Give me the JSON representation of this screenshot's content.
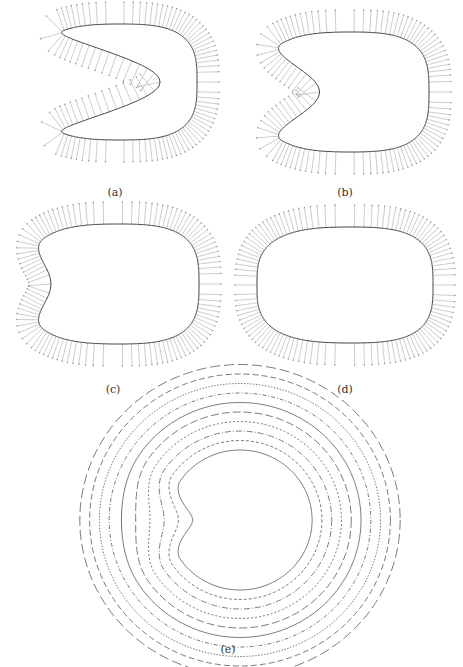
{
  "figure": {
    "panels": [
      {
        "id": "a",
        "label": "(a)",
        "cx": 115,
        "cy": 82,
        "rx": 82,
        "ry": 58,
        "notch_depth": 1.0,
        "label_x": 115,
        "label_y": 186
      },
      {
        "id": "b",
        "label": "(b)",
        "cx": 345,
        "cy": 92,
        "rx": 84,
        "ry": 60,
        "notch_depth": 0.45,
        "label_x": 345,
        "label_y": 186
      },
      {
        "id": "c",
        "label": "(c)",
        "cx": 113,
        "cy": 284,
        "rx": 86,
        "ry": 60,
        "notch_depth": 0.18,
        "label_x": 113,
        "label_y": 383
      },
      {
        "id": "d",
        "label": "(d)",
        "cx": 345,
        "cy": 285,
        "rx": 88,
        "ry": 58,
        "notch_depth": 0.0,
        "label_x": 345,
        "label_y": 383
      },
      {
        "id": "e",
        "label": "(e)",
        "cx": 230,
        "cy": 520,
        "r": 110,
        "label_x": 228,
        "label_y": 643
      }
    ],
    "colors": {
      "curve": "#444444",
      "normals": "#9a9a9a",
      "contour": "#555555"
    },
    "contour_levels": 10,
    "normal_count": 110
  }
}
